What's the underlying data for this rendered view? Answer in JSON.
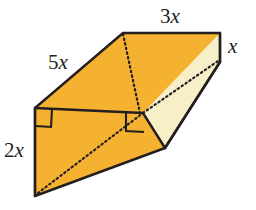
{
  "figure": {
    "type": "geometric-solid-diagram",
    "solid": "triangular prism (wedge)",
    "colors": {
      "face_fill": "#F5B230",
      "face_fill_light": "#F7EFC8",
      "edge_stroke": "#231f20",
      "hidden_edge_stroke": "#231f20",
      "label_color": "#231f20",
      "background": "#ffffff"
    },
    "labels": [
      {
        "id": "top-edge",
        "name": "label-3x",
        "coefficient": "3",
        "variable": "x",
        "text": "3x"
      },
      {
        "id": "depth-edge",
        "name": "label-x-right",
        "coefficient": "",
        "variable": "x",
        "text": "x"
      },
      {
        "id": "slant-edge",
        "name": "label-5x",
        "coefficient": "5",
        "variable": "x",
        "text": "5x"
      },
      {
        "id": "height-edge",
        "name": "label-2x",
        "coefficient": "2",
        "variable": "x",
        "text": "2x"
      }
    ],
    "right_angle_marks": 2,
    "hidden_edges": [
      "vertical dotted edge from top-back-left down to interior junction",
      "dotted diagonal across front face from bottom-left vertex to right-angle corner",
      "dotted diagonal on light right face"
    ]
  }
}
